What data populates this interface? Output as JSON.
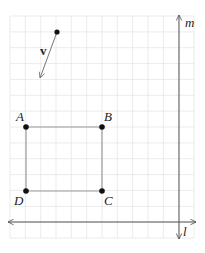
{
  "diagram": {
    "title": "",
    "grid": {
      "x_lines": [
        10,
        25.3,
        40.7,
        56,
        71.3,
        86.7,
        102,
        117.3,
        132.7,
        148,
        163.3,
        178.7,
        194
      ],
      "y_lines": [
        16,
        31.9,
        47.7,
        63.6,
        79.4,
        95.3,
        111.1,
        127,
        142.9,
        158.7,
        174.6,
        190.4,
        206.3,
        222.1,
        238
      ],
      "color": "#e6e6e6"
    },
    "axes": {
      "m": {
        "label": "m",
        "x": 179,
        "y1": 15,
        "y2": 239,
        "label_x": 185,
        "label_y": 27
      },
      "l": {
        "label": "l",
        "y": 222,
        "x1": 8,
        "x2": 196,
        "label_x": 183,
        "label_y": 236
      }
    },
    "points": [
      {
        "name": "A",
        "x": 26,
        "y": 127,
        "label": "A",
        "label_x": 16,
        "label_y": 121
      },
      {
        "name": "B",
        "x": 102,
        "y": 127,
        "label": "B",
        "label_x": 104,
        "label_y": 121
      },
      {
        "name": "C",
        "x": 102,
        "y": 191,
        "label": "C",
        "label_x": 104,
        "label_y": 205
      },
      {
        "name": "D",
        "x": 26,
        "y": 191,
        "label": "D",
        "label_x": 14,
        "label_y": 205
      }
    ],
    "segments": [
      [
        "A",
        "B"
      ],
      [
        "B",
        "C"
      ],
      [
        "C",
        "D"
      ],
      [
        "D",
        "A"
      ]
    ],
    "vector": {
      "label": "v",
      "start": {
        "x": 57,
        "y": 32
      },
      "end": {
        "x": 40,
        "y": 78
      },
      "label_x": 40,
      "label_y": 55
    },
    "colors": {
      "axis": "#555555",
      "segment": "#9a9a9a",
      "point": "#111111",
      "text": "#222222"
    }
  }
}
